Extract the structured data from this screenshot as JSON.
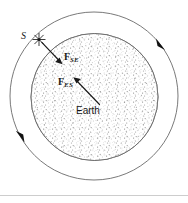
{
  "figure": {
    "type": "physics-diagram",
    "caption_text": "",
    "background_color": "#ffffff",
    "line_color": "#555555",
    "ink_color": "#1a1a1a",
    "stipple_color": "#9a9a9a",
    "width_px": 188,
    "height_px": 203
  },
  "labels": {
    "sun": "S",
    "sun_symbol": "sun-star-glyph",
    "earth": "Earth",
    "force_sun_on_earth": "F",
    "force_sun_on_earth_subscript": "SE",
    "force_earth_on_sun": "F",
    "force_earth_on_sun_subscript": "ES"
  },
  "geometry": {
    "orbit": {
      "center_x": 94,
      "center_y": 96,
      "radius": 84,
      "stroke": "#666666",
      "stroke_width": 0.9
    },
    "earth": {
      "center_x": 94.5,
      "center_y": 97,
      "radius": 64,
      "stroke": "#666666",
      "stroke_width": 0.9,
      "fill": "#ffffff"
    },
    "sun": {
      "x": 39,
      "y": 39.5,
      "ray_count": 8,
      "ray_length": 6.2
    },
    "force_se_arrow": {
      "x1": 41.5,
      "y1": 42,
      "x2": 61.5,
      "y2": 63,
      "label": "F_SE"
    },
    "force_es_arrow": {
      "x1": 99.5,
      "y1": 104.5,
      "x2": 73.5,
      "y2": 77.5,
      "label": "F_ES"
    },
    "orbit_direction_arrows": [
      {
        "name": "upper-right",
        "angle_deg": -38,
        "direction": "clockwise"
      },
      {
        "name": "lower-left",
        "angle_deg": 152,
        "direction": "clockwise"
      }
    ]
  },
  "divider": {
    "present": true,
    "y": 195,
    "color": "#b8b8b8"
  }
}
